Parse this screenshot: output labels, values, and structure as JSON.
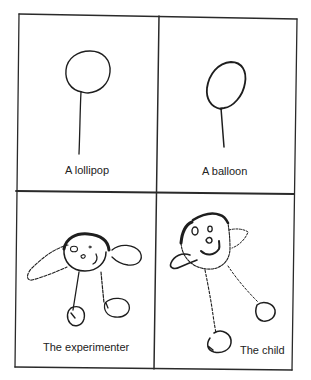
{
  "figure": {
    "layout": "2x2 grid",
    "border_color": "#2a2a2a",
    "stroke_color": "#1e1e1e",
    "panels": [
      {
        "id": "lollipop",
        "position": "top-left",
        "caption": "A lollipop"
      },
      {
        "id": "balloon",
        "position": "top-right",
        "caption": "A balloon"
      },
      {
        "id": "experimenter",
        "position": "bottom-left",
        "caption": "The experimenter"
      },
      {
        "id": "child",
        "position": "bottom-right",
        "caption": "The child"
      }
    ]
  }
}
